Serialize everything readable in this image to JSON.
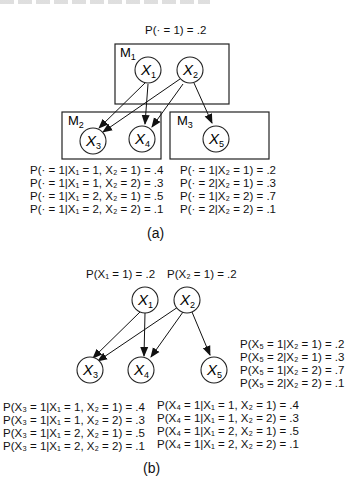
{
  "panel_a": {
    "prior_label": "P(· = 1) = .2",
    "modules": [
      {
        "id": "M1",
        "label": "M",
        "sub": "1",
        "nodes": [
          "X1",
          "X2"
        ]
      },
      {
        "id": "M2",
        "label": "M",
        "sub": "2",
        "nodes": [
          "X3",
          "X4"
        ]
      },
      {
        "id": "M3",
        "label": "M",
        "sub": "3",
        "nodes": [
          "X5"
        ]
      }
    ],
    "nodes": [
      {
        "id": "X1",
        "name": "X",
        "sub": "1"
      },
      {
        "id": "X2",
        "name": "X",
        "sub": "2"
      },
      {
        "id": "X3",
        "name": "X",
        "sub": "3"
      },
      {
        "id": "X4",
        "name": "X",
        "sub": "4"
      },
      {
        "id": "X5",
        "name": "X",
        "sub": "5"
      }
    ],
    "edges": [
      [
        "X1",
        "X3"
      ],
      [
        "X1",
        "X4"
      ],
      [
        "X2",
        "X3"
      ],
      [
        "X2",
        "X4"
      ],
      [
        "X2",
        "X5"
      ]
    ],
    "cpt_m2": [
      "P(· = 1|X₁ = 1, X₂ = 1) = .4",
      "P(· = 1|X₁ = 1, X₂ = 2) = .3",
      "P(· = 1|X₁ = 2, X₂ = 1) = .5",
      "P(· = 1|X₁ = 2, X₂ = 2) = .1"
    ],
    "cpt_m3": [
      "P(· = 1|X₂ = 1) = .2",
      "P(· = 2|X₂ = 1) = .3",
      "P(· = 1|X₂ = 2) = .7",
      "P(· = 2|X₂ = 2) = .1"
    ],
    "caption": "(a)"
  },
  "panel_b": {
    "prior_x1": "P(X₁ = 1) = .2",
    "prior_x2": "P(X₂ = 1) = .2",
    "nodes": [
      {
        "id": "X1",
        "name": "X",
        "sub": "1"
      },
      {
        "id": "X2",
        "name": "X",
        "sub": "2"
      },
      {
        "id": "X3",
        "name": "X",
        "sub": "3"
      },
      {
        "id": "X4",
        "name": "X",
        "sub": "4"
      },
      {
        "id": "X5",
        "name": "X",
        "sub": "5"
      }
    ],
    "edges": [
      [
        "X1",
        "X3"
      ],
      [
        "X1",
        "X4"
      ],
      [
        "X2",
        "X3"
      ],
      [
        "X2",
        "X4"
      ],
      [
        "X2",
        "X5"
      ]
    ],
    "cpt_x5": [
      "P(X₅ = 1|X₂ = 1) = .2",
      "P(X₅ = 2|X₂ = 1) = .3",
      "P(X₅ = 1|X₂ = 2) = .7",
      "P(X₅ = 2|X₂ = 2) = .1"
    ],
    "cpt_x3": [
      "P(X₃ = 1|X₁ = 1, X₂ = 1) = .4",
      "P(X₃ = 1|X₁ = 1, X₂ = 2) = .3",
      "P(X₃ = 1|X₁ = 2, X₂ = 1) = .5",
      "P(X₃ = 1|X₁ = 2, X₂ = 2) = .1"
    ],
    "cpt_x4": [
      "P(X₄ = 1|X₁ = 1, X₂ = 1) = .4",
      "P(X₄ = 1|X₁ = 1, X₂ = 2) = .3",
      "P(X₄ = 1|X₁ = 2, X₂ = 1) = .5",
      "P(X₄ = 1|X₁ = 2, X₂ = 2) = .1"
    ],
    "caption": "(b)"
  }
}
